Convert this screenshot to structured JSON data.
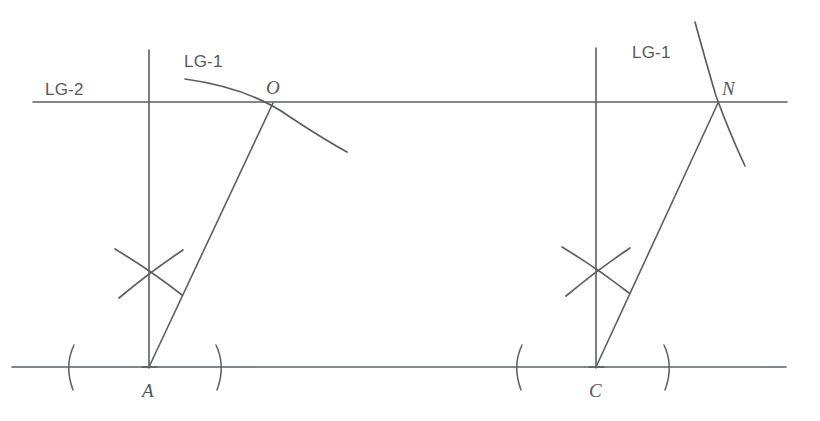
{
  "figure": {
    "background_color": "#ffffff",
    "ink_color": "#5b5f63",
    "width": 820,
    "height": 421
  },
  "labels": {
    "lg2_left": "LG-2",
    "lg1_left": "LG-1",
    "lg1_right": "LG-1",
    "point_o": "O",
    "point_n": "N",
    "point_a": "A",
    "point_c": "C"
  },
  "geometry": {
    "upper_line": {
      "name": "LG-2",
      "x1": 33,
      "y1": 102,
      "x2": 787,
      "y2": 102
    },
    "lower_line": {
      "name": "baseline",
      "x1": 12,
      "y1": 367,
      "x2": 786,
      "y2": 367
    },
    "vertical_left": {
      "x": 149,
      "y_top": 50,
      "y_bottom": 368
    },
    "vertical_right": {
      "x": 596,
      "y_top": 48,
      "y_bottom": 368
    },
    "transversal_left": {
      "x1": 149,
      "y1": 367,
      "x2": 273,
      "y2": 103
    },
    "transversal_right": {
      "x1": 596,
      "y1": 367,
      "x2": 718,
      "y2": 103
    },
    "points": [
      {
        "label": "O",
        "x": 273,
        "y": 103
      },
      {
        "label": "N",
        "x": 718,
        "y": 103
      },
      {
        "label": "A",
        "x": 149,
        "y": 367
      },
      {
        "label": "C",
        "x": 596,
        "y": 367
      }
    ],
    "arc_lg1_left": {
      "start_x": 185,
      "start_y": 79,
      "through_x": 273,
      "through_y": 103,
      "end_x": 347,
      "end_y": 152
    },
    "arc_lg1_right": {
      "start_x": 695,
      "start_y": 22,
      "through_x": 718,
      "through_y": 103,
      "end_x": 745,
      "end_y": 166
    },
    "cross_marks": [
      {
        "center_x": 150,
        "center_y": 272
      },
      {
        "center_x": 597,
        "center_y": 270
      }
    ],
    "baseline_tick_marks": [
      {
        "type": "open-paren",
        "x": 70,
        "y": 367
      },
      {
        "type": "close-paren",
        "x": 220,
        "y": 367
      },
      {
        "type": "open-paren",
        "x": 518,
        "y": 367
      },
      {
        "type": "close-paren",
        "x": 668,
        "y": 367
      }
    ]
  }
}
